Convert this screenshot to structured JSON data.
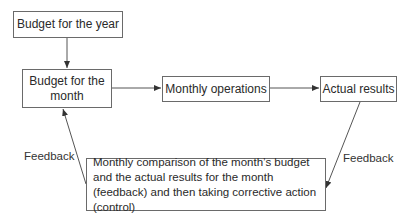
{
  "diagram": {
    "nodes": {
      "budget_year": "Budget for the year",
      "budget_month": "Budget for the month",
      "monthly_operations": "Monthly operations",
      "actual_results": "Actual results",
      "comparison": "Monthly comparison of the month’s budget and the actual results for the month (feedback) and then taking corrective action (control)"
    },
    "edge_labels": {
      "feedback_left": "Feedback",
      "feedback_right": "Feedback"
    },
    "edges": [
      {
        "from": "budget_year",
        "to": "budget_month"
      },
      {
        "from": "budget_month",
        "to": "monthly_operations"
      },
      {
        "from": "monthly_operations",
        "to": "actual_results"
      },
      {
        "from": "actual_results",
        "to": "comparison",
        "label": "Feedback"
      },
      {
        "from": "comparison",
        "to": "budget_month",
        "label": "Feedback"
      }
    ],
    "colors": {
      "line": "#555555",
      "border": "#6a6a6a",
      "text": "#2a2a2a"
    }
  }
}
